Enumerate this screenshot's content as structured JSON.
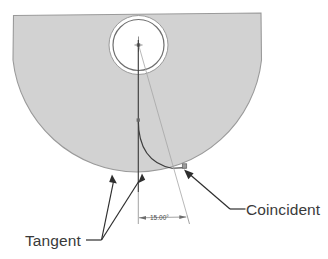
{
  "drawing": {
    "title": "Sketch relations callout diagram",
    "colors": {
      "body_fill": "#d2d2d2",
      "body_stroke": "#9a9a9a",
      "hole_fill": "#ffffff",
      "hole_stroke": "#8c8c8c",
      "sketch_line": "#3d3d3d",
      "construction_line": "#a8a8a8",
      "dimension_line": "#8a8a8a",
      "leader_line": "#2e2e2e",
      "label_color": "#3a3a3a",
      "background": "#ffffff"
    },
    "shapes": {
      "body_name": "semicircular-plate",
      "hole_outer_name": "hole-outer-circle",
      "hole_inner_name": "hole-inner-circle",
      "center_mark_name": "hole-center-mark",
      "vertical_line_name": "vertical-sketch-line",
      "spline_name": "tangent-arc-sketch",
      "construction_name": "angle-construction-line"
    }
  },
  "dimensions": [
    {
      "id": "angle-dimension",
      "value": "15.00°",
      "type": "angular"
    }
  ],
  "annotations": [
    {
      "id": "tangent-callout",
      "label": "Tangent",
      "leader_count": 2
    },
    {
      "id": "coincident-callout",
      "label": "Coincident",
      "leader_count": 1
    }
  ]
}
